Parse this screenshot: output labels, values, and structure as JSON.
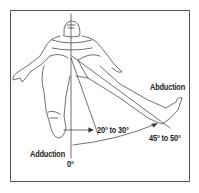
{
  "diagram": {
    "labels": {
      "abduction": "Abduction",
      "adduction": "Adduction",
      "zero": "0°",
      "adduction_range": "20° to 30°",
      "abduction_range": "45° to 50°"
    },
    "colors": {
      "line": "#333333",
      "frame": "#555555",
      "background": "#ffffff"
    }
  }
}
